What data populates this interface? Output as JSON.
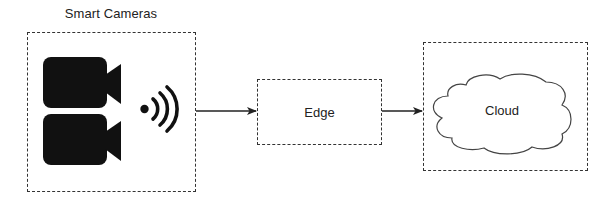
{
  "diagram": {
    "title": "Smart Cameras",
    "nodes": [
      {
        "id": "smart-cameras",
        "label": "Smart Cameras",
        "icons": [
          "video-camera-icon",
          "video-camera-icon",
          "wireless-signal-icon"
        ]
      },
      {
        "id": "edge",
        "label": "Edge"
      },
      {
        "id": "cloud",
        "label": "Cloud",
        "shape": "cloud"
      }
    ],
    "edges": [
      {
        "from": "smart-cameras",
        "to": "edge"
      },
      {
        "from": "edge",
        "to": "cloud"
      }
    ],
    "colors": {
      "stroke": "#333333",
      "icon_fill": "#111111",
      "text": "#222222",
      "background": "#ffffff"
    }
  }
}
